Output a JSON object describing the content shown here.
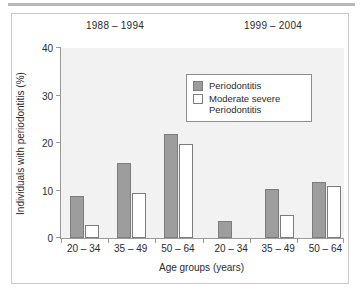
{
  "chart_data": {
    "type": "bar",
    "title": "",
    "panels": [
      {
        "label": "1988 – 1994"
      },
      {
        "label": "1999 – 2004"
      }
    ],
    "categories": [
      "20 – 34",
      "35 – 49",
      "50 – 64",
      "20 – 34",
      "35 – 49",
      "50 – 64"
    ],
    "series": [
      {
        "name": "Periodontitis",
        "color": "#9d9d9d",
        "values": [
          8.8,
          15.8,
          21.8,
          3.6,
          10.3,
          11.8
        ]
      },
      {
        "name": "Moderate severe Periodontitis",
        "color": "#ffffff",
        "values": [
          2.7,
          9.4,
          19.7,
          0,
          4.8,
          10.9
        ]
      }
    ],
    "xlabel": "Age groups (years)",
    "ylabel": "Individuals with periodontitis (%)",
    "ylim": [
      0,
      40
    ],
    "yticks": [
      0,
      10,
      20,
      30,
      40
    ],
    "ytick_labels": [
      "0",
      "10",
      "20",
      "30",
      "40"
    ],
    "grid": false,
    "legend_position": "upper-center",
    "legend_entries": [
      {
        "label": "Periodontitis",
        "swatch": "filled-gray"
      },
      {
        "label": "Moderate severe Periodontitis",
        "swatch": "outlined-white"
      }
    ],
    "plot_background": "#f2f2f2",
    "axis_color": "#9a9a9a",
    "bar_edge_color": "#7c7c7c"
  }
}
